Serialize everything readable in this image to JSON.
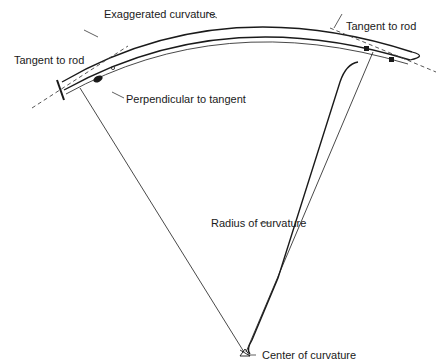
{
  "diagram": {
    "labels": {
      "exaggerated_curvature": "Exaggerated curvature",
      "tangent_left": "Tangent to rod",
      "tangent_right": "Tangent to rod",
      "perpendicular": "Perpendicular to tangent",
      "radius": "Radius of curvature",
      "center": "Center of curvature"
    },
    "colors": {
      "line": "#1a1a1a",
      "background": "#ffffff"
    }
  }
}
